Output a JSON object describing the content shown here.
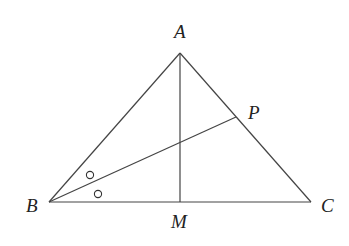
{
  "diagram": {
    "type": "triangle",
    "points": {
      "A": {
        "label": "A",
        "x": 180,
        "y": 53
      },
      "B": {
        "label": "B",
        "x": 49,
        "y": 202
      },
      "C": {
        "label": "C",
        "x": 311,
        "y": 202
      },
      "M": {
        "label": "M",
        "x": 180,
        "y": 202
      },
      "P": {
        "label": "P",
        "x": 236,
        "y": 117
      }
    },
    "segments": [
      "AB",
      "AC",
      "BC",
      "AM",
      "BP"
    ],
    "angle_marks": {
      "vertex": "B",
      "symbol": "circle",
      "count": 2,
      "meaning": "BP bisects angle B"
    }
  }
}
